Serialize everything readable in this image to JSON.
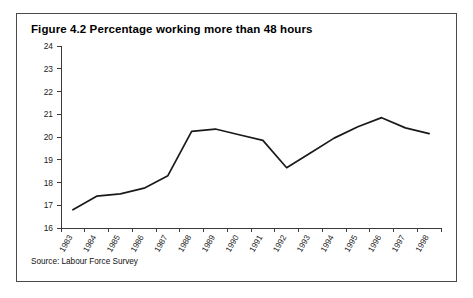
{
  "figure": {
    "title": "Figure 4.2 Percentage working more than 48 hours",
    "source": "Source: Labour Force Survey"
  },
  "chart_data": {
    "type": "line",
    "title": "Figure 4.2 Percentage working more than 48 hours",
    "xlabel": "",
    "ylabel": "",
    "categories": [
      "1983",
      "1984",
      "1985",
      "1986",
      "1987",
      "1988",
      "1989",
      "1990",
      "1991",
      "1992",
      "1993",
      "1994",
      "1995",
      "1996",
      "1997",
      "1998"
    ],
    "values": [
      16.8,
      17.4,
      17.5,
      17.75,
      18.3,
      20.25,
      20.35,
      20.1,
      19.85,
      18.65,
      19.3,
      19.95,
      20.45,
      20.85,
      20.4,
      20.15
    ],
    "series": [
      {
        "name": "Percentage working more than 48 hours",
        "values": [
          16.8,
          17.4,
          17.5,
          17.75,
          18.3,
          20.25,
          20.35,
          20.1,
          19.85,
          18.65,
          19.3,
          19.95,
          20.45,
          20.85,
          20.4,
          20.15
        ]
      }
    ],
    "ylim": [
      16,
      24
    ],
    "yticks": [
      16,
      17,
      18,
      19,
      20,
      21,
      22,
      23,
      24
    ],
    "ytick_labels": [
      "16",
      "17",
      "18",
      "19",
      "20",
      "21",
      "22",
      "23",
      "24"
    ],
    "grid": false,
    "legend": "none",
    "line_color": "#1a1a1a",
    "axis_color": "#3b3b3b",
    "border_color": "#4a4a4a"
  }
}
